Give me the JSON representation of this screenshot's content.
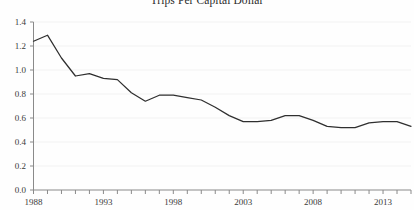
{
  "chart_data": {
    "type": "line",
    "title": "Trips Per Capital Dollar",
    "xlabel": "",
    "ylabel": "",
    "xlim": [
      1988,
      2015
    ],
    "ylim": [
      0.0,
      1.4
    ],
    "grid": true,
    "legend": "none",
    "line_color": "#2f2f2f",
    "gridline_color": "#f2f2f2",
    "axis_color": "#8a8a8a",
    "background_color": "#fefefe",
    "ytick_labels": [
      "0.0",
      "0.2",
      "0.4",
      "0.6",
      "0.8",
      "1.0",
      "1.2",
      "1.4"
    ],
    "ytick_values": [
      0.0,
      0.2,
      0.4,
      0.6,
      0.8,
      1.0,
      1.2,
      1.4
    ],
    "xtick_labels": [
      "1988",
      "1993",
      "1998",
      "2003",
      "2008",
      "2013"
    ],
    "xtick_values": [
      1988,
      1993,
      1998,
      2003,
      2008,
      2013
    ],
    "xtick_minor_values": [
      1988,
      1989,
      1990,
      1991,
      1992,
      1993,
      1994,
      1995,
      1996,
      1997,
      1998,
      1999,
      2000,
      2001,
      2002,
      2003,
      2004,
      2005,
      2006,
      2007,
      2008,
      2009,
      2010,
      2011,
      2012,
      2013,
      2014,
      2015
    ],
    "x": [
      1988,
      1989,
      1990,
      1991,
      1992,
      1993,
      1994,
      1995,
      1996,
      1997,
      1998,
      1999,
      2000,
      2001,
      2002,
      2003,
      2004,
      2005,
      2006,
      2007,
      2008,
      2009,
      2010,
      2011,
      2012,
      2013,
      2014,
      2015
    ],
    "values": [
      1.24,
      1.29,
      1.1,
      0.95,
      0.97,
      0.93,
      0.92,
      0.81,
      0.74,
      0.79,
      0.79,
      0.77,
      0.75,
      0.69,
      0.62,
      0.57,
      0.57,
      0.58,
      0.62,
      0.62,
      0.58,
      0.53,
      0.52,
      0.52,
      0.56,
      0.57,
      0.57,
      0.53
    ]
  }
}
